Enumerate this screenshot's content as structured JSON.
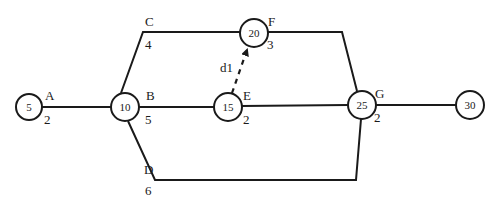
{
  "diagram": {
    "type": "activity-on-arrow network",
    "nodes": [
      {
        "id": "n5",
        "label": "5"
      },
      {
        "id": "n10",
        "label": "10"
      },
      {
        "id": "n15",
        "label": "15"
      },
      {
        "id": "n20",
        "label": "20"
      },
      {
        "id": "n25",
        "label": "25"
      },
      {
        "id": "n30",
        "label": "30"
      }
    ],
    "activities": [
      {
        "name": "A",
        "duration": "2",
        "from": "5",
        "to": "10"
      },
      {
        "name": "B",
        "duration": "5",
        "from": "10",
        "to": "15"
      },
      {
        "name": "C",
        "duration": "4",
        "from": "10",
        "to": "20"
      },
      {
        "name": "D",
        "duration": "6",
        "from": "10",
        "to": "25"
      },
      {
        "name": "E",
        "duration": "2",
        "from": "15",
        "to": "25"
      },
      {
        "name": "F",
        "duration": "3",
        "from": "20",
        "to": "25"
      },
      {
        "name": "G",
        "duration": "2",
        "from": "25",
        "to": "30"
      }
    ],
    "dummy": {
      "name": "d1",
      "from": "15",
      "to": "20",
      "style": "dashed"
    }
  }
}
